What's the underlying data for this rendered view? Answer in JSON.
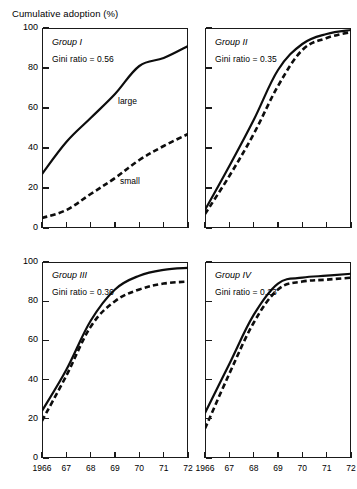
{
  "chart_data": {
    "type": "line",
    "title": "Cumulative adoption (%)",
    "xlabel": "",
    "ylabel": "Cumulative adoption (%)",
    "x": [
      1966,
      1967,
      1968,
      1969,
      1970,
      1971,
      1972
    ],
    "x_tick_labels": [
      "1966",
      "67",
      "68",
      "69",
      "70",
      "71",
      "72"
    ],
    "y_tick_labels": [
      "0",
      "20",
      "40",
      "60",
      "80",
      "100"
    ],
    "y_ticks": [
      0,
      20,
      40,
      60,
      80,
      100
    ],
    "ylim": [
      0,
      100
    ],
    "xlim": [
      1966,
      1972
    ],
    "grid": false,
    "legend": "inline-annotations",
    "series_styles": [
      {
        "name": "large",
        "style": "solid",
        "color": "#000000"
      },
      {
        "name": "small",
        "style": "dashed",
        "color": "#000000"
      }
    ],
    "panels": [
      {
        "id": "group-1",
        "group": "Group I",
        "gini": "Gini ratio = 0.56",
        "annotations": [
          {
            "text": "large",
            "series": "large"
          },
          {
            "text": "small",
            "series": "small"
          }
        ],
        "series": [
          {
            "name": "large",
            "style": "solid",
            "values": [
              27,
              43,
              55,
              67,
              81,
              85,
              91
            ]
          },
          {
            "name": "small",
            "style": "dashed",
            "values": [
              5,
              9,
              17,
              25,
              34,
              41,
              47
            ]
          }
        ]
      },
      {
        "id": "group-2",
        "group": "Group II",
        "gini": "Gini ratio = 0.35",
        "annotations": [],
        "series": [
          {
            "name": "large",
            "style": "solid",
            "values": [
              9,
              31,
              54,
              79,
              92,
              97,
              99
            ]
          },
          {
            "name": "small",
            "style": "dashed",
            "values": [
              7,
              26,
              47,
              71,
              89,
              95,
              98
            ]
          }
        ]
      },
      {
        "id": "group-3",
        "group": "Group III",
        "gini": "Gini ratio = 0.36",
        "annotations": [],
        "series": [
          {
            "name": "large",
            "style": "solid",
            "values": [
              24,
              45,
              70,
              86,
              93,
              96,
              97
            ]
          },
          {
            "name": "small",
            "style": "dashed",
            "values": [
              19,
              42,
              67,
              80,
              86,
              89,
              90
            ]
          }
        ]
      },
      {
        "id": "group-4",
        "group": "Group IV",
        "gini": "Gini ratio = 0.23",
        "annotations": [],
        "series": [
          {
            "name": "large",
            "style": "solid",
            "values": [
              23,
              48,
              73,
              89,
              92,
              93,
              94
            ]
          },
          {
            "name": "small",
            "style": "dashed",
            "values": [
              15,
              43,
              69,
              86,
              90,
              91,
              92
            ]
          }
        ]
      }
    ]
  },
  "figure": {
    "axis_title": "Cumulative adoption (%)"
  }
}
